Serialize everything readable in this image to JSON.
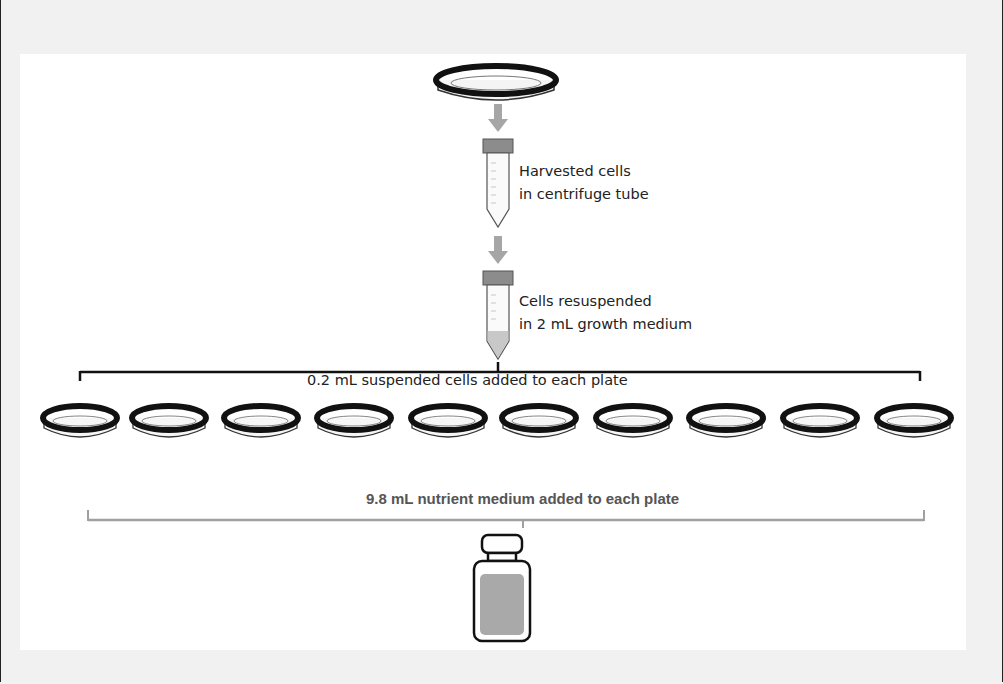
{
  "diagram": {
    "steps": [
      {
        "id": "source-plate",
        "label": ""
      },
      {
        "id": "harvested-tube",
        "label_lines": [
          "Harvested cells",
          "in centrifuge tube"
        ]
      },
      {
        "id": "resuspended-tube",
        "label_lines": [
          "Cells resuspended",
          "in 2 mL growth medium"
        ]
      }
    ],
    "distribution": {
      "label": "0.2 mL suspended cells added to each plate",
      "plate_count": 10
    },
    "nutrient": {
      "label": "9.8 mL nutrient medium added to each plate",
      "container": "bottle"
    },
    "colors": {
      "arrow": "#a6a6a6",
      "tube_cap": "#8c8c8c",
      "plate_rim": "#111111",
      "medium_fill": "#a9a9a9",
      "bracket_black": "#111111",
      "bracket_gray": "#a0a0a0"
    }
  }
}
